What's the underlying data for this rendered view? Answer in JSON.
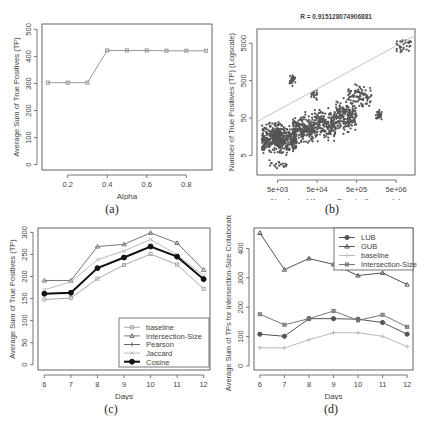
{
  "chart_data": [
    {
      "id": "a",
      "caption": "(a)",
      "type": "line",
      "title": "",
      "xlabel": "Alpha",
      "ylabel": "Average Sum of True Positives (TP)",
      "x": [
        0.1,
        0.2,
        0.3,
        0.4,
        0.5,
        0.6,
        0.7,
        0.8,
        0.9
      ],
      "series": [
        {
          "name": "TP",
          "values": [
            303,
            303,
            303,
            422,
            422,
            422,
            421,
            421,
            421
          ],
          "color": "#999999"
        }
      ],
      "xticks": [
        0.2,
        0.4,
        0.6,
        0.8
      ],
      "xtick_labels": [
        "0.2",
        "0.4",
        "0.6",
        "0.8"
      ],
      "yticks": [
        0,
        100,
        200,
        300,
        400,
        500
      ],
      "ytick_labels": [
        "0",
        "100",
        "200",
        "300",
        "400",
        "500"
      ],
      "xlim": [
        0.07,
        0.93
      ],
      "ylim": [
        -20,
        520
      ],
      "grid": false
    },
    {
      "id": "b",
      "caption": "(b)",
      "type": "scatter",
      "title": "R = 0.915128074906881",
      "xlabel": "Number of Known Events (Logscale)",
      "ylabel": "Number of True Positives (TP) (Logscale)",
      "xscale": "log",
      "yscale": "log",
      "xticks": [
        5000,
        50000,
        500000,
        5000000
      ],
      "xtick_labels": [
        "5e+03",
        "5e+04",
        "5e+05",
        "5e+06"
      ],
      "yticks": [
        5,
        50,
        500,
        5000
      ],
      "ytick_labels": [
        "5",
        "50",
        "500",
        "5000"
      ],
      "xlim": [
        1500,
        15000000
      ],
      "ylim": [
        1.5,
        12000
      ],
      "fit_line": {
        "from": [
          1500,
          40
        ],
        "to": [
          15000000,
          8000
        ],
        "color": "#bbbbbb"
      },
      "clusters": [
        {
          "x": [
            2000,
            6000
          ],
          "y": [
            5,
            45
          ],
          "n": 260
        },
        {
          "x": [
            5000,
            15000
          ],
          "y": [
            4,
            40
          ],
          "n": 220
        },
        {
          "x": [
            12000,
            40000
          ],
          "y": [
            8,
            80
          ],
          "n": 200
        },
        {
          "x": [
            40000,
            150000
          ],
          "y": [
            10,
            120
          ],
          "n": 200
        },
        {
          "x": [
            150000,
            500000
          ],
          "y": [
            15,
            200
          ],
          "n": 200
        },
        {
          "x": [
            300000,
            1200000
          ],
          "y": [
            80,
            450
          ],
          "n": 90
        },
        {
          "x": [
            1500000,
            2200000
          ],
          "y": [
            40,
            90
          ],
          "n": 30
        },
        {
          "x": [
            10000,
            14000
          ],
          "y": [
            300,
            900
          ],
          "n": 25
        },
        {
          "x": [
            35000,
            50000
          ],
          "y": [
            150,
            300
          ],
          "n": 18
        },
        {
          "x": [
            5000000,
            12000000
          ],
          "y": [
            2500,
            8000
          ],
          "n": 30
        },
        {
          "x": [
            3000,
            9000
          ],
          "y": [
            2,
            4
          ],
          "n": 18
        }
      ],
      "point_color": "#555555",
      "grid": false
    },
    {
      "id": "c",
      "caption": "(c)",
      "type": "line",
      "title": "",
      "xlabel": "Days",
      "ylabel": "Average Sum of True Positives (TP)",
      "x": [
        6,
        7,
        8,
        9,
        10,
        11,
        12
      ],
      "series": [
        {
          "name": "baseline",
          "values": [
            148,
            151,
            195,
            226,
            251,
            227,
            172
          ],
          "color": "#aaaaaa",
          "marker": "square",
          "width": 1
        },
        {
          "name": "Intersection-Size",
          "values": [
            191,
            191,
            268,
            273,
            299,
            276,
            215
          ],
          "color": "#777777",
          "marker": "triangle",
          "width": 1
        },
        {
          "name": "Pearson",
          "values": [
            161,
            163,
            219,
            243,
            268,
            245,
            194
          ],
          "color": "#666666",
          "marker": "plus",
          "width": 1
        },
        {
          "name": "Jaccard",
          "values": [
            170,
            188,
            238,
            258,
            284,
            249,
            202
          ],
          "color": "#bbbbbb",
          "marker": "x",
          "width": 1
        },
        {
          "name": "Cosine",
          "values": [
            161,
            163,
            219,
            243,
            268,
            245,
            194
          ],
          "color": "#111111",
          "marker": "circle",
          "width": 2
        }
      ],
      "xticks": [
        6,
        7,
        8,
        9,
        10,
        11,
        12
      ],
      "xtick_labels": [
        "6",
        "7",
        "8",
        "9",
        "10",
        "11",
        "12"
      ],
      "yticks": [
        0,
        50,
        100,
        150,
        200,
        250,
        300
      ],
      "ytick_labels": [
        "0",
        "50",
        "100",
        "150",
        "200",
        "250",
        "300"
      ],
      "xlim": [
        5.76,
        12.24
      ],
      "ylim": [
        -12,
        310
      ],
      "legend": {
        "position": "bottom-right",
        "entries": [
          "baseline",
          "Intersection-Size",
          "Pearson",
          "Jaccard",
          "Cosine"
        ]
      },
      "grid": false
    },
    {
      "id": "d",
      "caption": "(d)",
      "type": "line",
      "title": "",
      "xlabel": "Days",
      "ylabel": "Average Sum of TPs for Intersection-Size Collaborators",
      "x": [
        6,
        7,
        8,
        9,
        10,
        11,
        12
      ],
      "series": [
        {
          "name": "LUB",
          "values": [
            108,
            101,
            161,
            161,
            159,
            148,
            108
          ],
          "color": "#555555",
          "marker": "circle",
          "width": 1
        },
        {
          "name": "GUB",
          "values": [
            453,
            328,
            366,
            346,
            308,
            317,
            277
          ],
          "color": "#555555",
          "marker": "triangle",
          "width": 1
        },
        {
          "name": "baseline",
          "values": [
            62,
            61,
            89,
            113,
            113,
            101,
            66
          ],
          "color": "#bbbbbb",
          "marker": "plus",
          "width": 1
        },
        {
          "name": "Intersection-Size",
          "values": [
            176,
            140,
            161,
            187,
            155,
            174,
            133
          ],
          "color": "#777777",
          "marker": "x-square",
          "width": 1
        }
      ],
      "xticks": [
        6,
        7,
        8,
        9,
        10,
        11,
        12
      ],
      "xtick_labels": [
        "6",
        "7",
        "8",
        "9",
        "10",
        "11",
        "12"
      ],
      "yticks": [
        0,
        100,
        200,
        300,
        400
      ],
      "ytick_labels": [
        "0",
        "100",
        "200",
        "300",
        "400"
      ],
      "xlim": [
        5.76,
        12.24
      ],
      "ylim": [
        -14,
        470
      ],
      "legend": {
        "position": "top-right",
        "entries": [
          "LUB",
          "GUB",
          "baseline",
          "Intersection-Size"
        ]
      },
      "grid": false
    }
  ]
}
